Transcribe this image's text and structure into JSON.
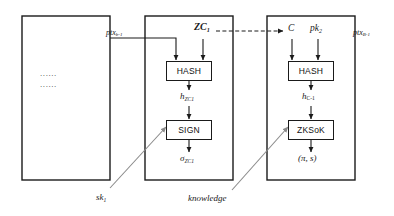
{
  "diagram": {
    "columns": [
      {
        "id": "left",
        "name": "preceding-transactions-box",
        "ellipsis_rows": [
          "......",
          "......"
        ]
      },
      {
        "id": "middle",
        "name": "sign-column-box",
        "top_label": "ZC",
        "top_label_sub": "1",
        "side_label": "ptx",
        "side_label_sub": "b-1",
        "ops": [
          {
            "label": "HASH"
          },
          {
            "label": "SIGN"
          }
        ],
        "intermediate": {
          "base": "h",
          "sub": "ZC1"
        },
        "output": {
          "base": "σ",
          "sub": "ZC1"
        }
      },
      {
        "id": "right",
        "name": "zksok-column-box",
        "inputs": [
          {
            "base": "C",
            "sub": ""
          },
          {
            "base": "pk",
            "sub": "2"
          }
        ],
        "side_label": "ptx",
        "side_label_sub": "B-1",
        "ops": [
          {
            "label": "HASH"
          },
          {
            "label": "ZKSoK"
          }
        ],
        "intermediate": {
          "base": "h",
          "sub": "C-1"
        },
        "output": "(π, s)"
      }
    ],
    "external_inputs": [
      {
        "name": "secret-key-label",
        "base": "sk",
        "sub": "1"
      },
      {
        "name": "knowledge-label",
        "text": "knowledge"
      }
    ],
    "colors": {
      "stroke": "#1a1a1a",
      "gray_arrow": "#8a8a8a",
      "text": "#1a1a1a",
      "background": "#ffffff"
    }
  }
}
